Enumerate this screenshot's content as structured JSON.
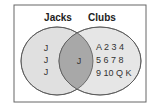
{
  "venn": {
    "sets": [
      {
        "name": "Jacks",
        "only": [
          "J",
          "J",
          "J"
        ]
      },
      {
        "name": "Clubs",
        "only_rows": [
          "A 2 3 4",
          "5 6 7 8",
          "9 10 Q K"
        ]
      }
    ],
    "intersection": [
      "J"
    ],
    "colors": {
      "left_fill": "#e0e0e0",
      "right_fill": "#e6e6e6",
      "overlap_fill": "#a8a8a8",
      "stroke": "#555555",
      "frame": "#666666"
    }
  },
  "labels": {
    "left": "Jacks",
    "right": "Clubs",
    "left_j1": "J",
    "left_j2": "J",
    "left_j3": "J",
    "overlap": "J",
    "row1": "A 2 3 4",
    "row2": "5 6 7 8",
    "row3": "9 10 Q K"
  }
}
